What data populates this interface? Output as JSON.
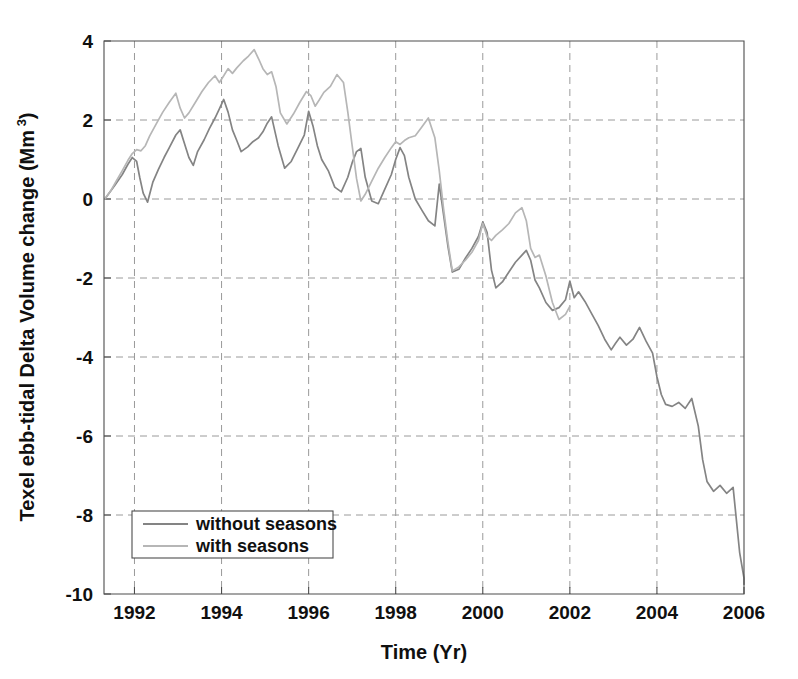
{
  "chart_data": {
    "type": "line",
    "title": "",
    "xlabel": "Time (Yr)",
    "ylabel": "Texel ebb-tidal Delta Volume change (Mm",
    "ylabel_superscript": "3",
    "ylabel_suffix": ")",
    "xlim": [
      1991.3,
      2006.0
    ],
    "ylim": [
      -10,
      4
    ],
    "xticks": [
      "1992",
      "1994",
      "1996",
      "1998",
      "2000",
      "2002",
      "2004",
      "2006"
    ],
    "xtick_values": [
      1992,
      1994,
      1996,
      1998,
      2000,
      2002,
      2004,
      2006
    ],
    "yticks": [
      "4",
      "2",
      "0",
      "-2",
      "-4",
      "-6",
      "-8",
      "-10"
    ],
    "ytick_values": [
      4,
      2,
      0,
      -2,
      -4,
      -6,
      -8,
      -10
    ],
    "grid": true,
    "grid_style": "dashed",
    "legend_position": "lower-left",
    "colors": {
      "without_seasons": "#848484",
      "with_seasons": "#b6b6b6",
      "axis": "#4d4d4d",
      "grid": "#9a9a9a",
      "text": "#101010",
      "background": "#ffffff"
    },
    "series": [
      {
        "name": "without seasons",
        "color": "#848484",
        "x": [
          1991.32,
          1991.55,
          1991.72,
          1991.85,
          1991.95,
          1992.05,
          1992.12,
          1992.2,
          1992.3,
          1992.42,
          1992.55,
          1992.68,
          1992.8,
          1992.95,
          1993.05,
          1993.15,
          1993.25,
          1993.35,
          1993.45,
          1993.6,
          1993.72,
          1993.85,
          1993.95,
          1994.05,
          1994.15,
          1994.25,
          1994.35,
          1994.45,
          1994.6,
          1994.72,
          1994.85,
          1994.95,
          1995.05,
          1995.15,
          1995.3,
          1995.45,
          1995.6,
          1995.75,
          1995.9,
          1996.0,
          1996.1,
          1996.2,
          1996.3,
          1996.45,
          1996.6,
          1996.75,
          1996.9,
          1997.0,
          1997.1,
          1997.2,
          1997.3,
          1997.45,
          1997.6,
          1997.75,
          1997.9,
          1998.0,
          1998.1,
          1998.2,
          1998.3,
          1998.45,
          1998.6,
          1998.75,
          1998.9,
          1999.0,
          1999.1,
          1999.2,
          1999.3,
          1999.45,
          1999.6,
          1999.75,
          1999.9,
          2000.0,
          2000.1,
          2000.2,
          2000.3,
          2000.45,
          2000.6,
          2000.75,
          2000.9,
          2001.0,
          2001.1,
          2001.2,
          2001.3,
          2001.45,
          2001.6,
          2001.75,
          2001.9,
          2002.0,
          2002.1,
          2002.2,
          2002.35,
          2002.5,
          2002.65,
          2002.8,
          2002.95,
          2003.05,
          2003.15,
          2003.3,
          2003.45,
          2003.6,
          2003.75,
          2003.9,
          2004.0,
          2004.1,
          2004.2,
          2004.35,
          2004.5,
          2004.65,
          2004.8,
          2004.95,
          2005.05,
          2005.15,
          2005.3,
          2005.45,
          2005.6,
          2005.75,
          2005.9,
          2006.0
        ],
        "y": [
          0.0,
          0.35,
          0.62,
          0.88,
          1.05,
          0.95,
          0.55,
          0.15,
          -0.08,
          0.42,
          0.75,
          1.05,
          1.3,
          1.62,
          1.75,
          1.4,
          1.05,
          0.85,
          1.2,
          1.5,
          1.78,
          2.05,
          2.28,
          2.52,
          2.2,
          1.75,
          1.48,
          1.2,
          1.32,
          1.45,
          1.55,
          1.7,
          1.92,
          2.08,
          1.35,
          0.78,
          0.95,
          1.28,
          1.62,
          2.22,
          1.85,
          1.35,
          1.0,
          0.72,
          0.3,
          0.18,
          0.55,
          0.92,
          1.2,
          1.28,
          0.55,
          -0.05,
          -0.12,
          0.25,
          0.62,
          1.0,
          1.3,
          1.1,
          0.55,
          0.0,
          -0.28,
          -0.55,
          -0.68,
          0.38,
          -0.4,
          -1.2,
          -1.85,
          -1.78,
          -1.5,
          -1.25,
          -0.95,
          -0.58,
          -0.85,
          -1.8,
          -2.25,
          -2.1,
          -1.85,
          -1.6,
          -1.42,
          -1.3,
          -1.55,
          -2.05,
          -2.25,
          -2.62,
          -2.82,
          -2.75,
          -2.55,
          -2.08,
          -2.5,
          -2.35,
          -2.6,
          -2.9,
          -3.2,
          -3.55,
          -3.82,
          -3.65,
          -3.5,
          -3.7,
          -3.55,
          -3.25,
          -3.6,
          -3.9,
          -4.5,
          -4.95,
          -5.2,
          -5.25,
          -5.15,
          -5.3,
          -5.05,
          -5.75,
          -6.6,
          -7.15,
          -7.4,
          -7.25,
          -7.45,
          -7.3,
          -8.95,
          -9.6
        ],
        "y_tail": [
          -9.6,
          -9.62,
          -9.7,
          -9.75
        ]
      },
      {
        "name": "with seasons",
        "color": "#b6b6b6",
        "x": [
          1991.32,
          1991.45,
          1991.58,
          1991.72,
          1991.85,
          1991.95,
          1992.05,
          1992.15,
          1992.25,
          1992.35,
          1992.5,
          1992.65,
          1992.8,
          1992.95,
          1993.05,
          1993.15,
          1993.25,
          1993.4,
          1993.55,
          1993.7,
          1993.85,
          1993.95,
          1994.05,
          1994.15,
          1994.25,
          1994.35,
          1994.5,
          1994.62,
          1994.75,
          1994.85,
          1994.95,
          1995.05,
          1995.15,
          1995.25,
          1995.35,
          1995.5,
          1995.65,
          1995.8,
          1995.95,
          1996.05,
          1996.15,
          1996.25,
          1996.35,
          1996.5,
          1996.65,
          1996.8,
          1996.9,
          1997.0,
          1997.1,
          1997.2,
          1997.3,
          1997.45,
          1997.6,
          1997.75,
          1997.9,
          1998.0,
          1998.1,
          1998.2,
          1998.3,
          1998.45,
          1998.6,
          1998.75,
          1998.9,
          1999.0,
          1999.1,
          1999.2,
          1999.3,
          1999.45,
          1999.6,
          1999.75,
          1999.9,
          2000.0,
          2000.1,
          2000.2,
          2000.3,
          2000.45,
          2000.6,
          2000.75,
          2000.9,
          2001.0,
          2001.1,
          2001.2,
          2001.3,
          2001.45,
          2001.6,
          2001.75,
          2001.9,
          2002.0
        ],
        "y": [
          0.0,
          0.2,
          0.45,
          0.72,
          0.98,
          1.15,
          1.25,
          1.22,
          1.35,
          1.6,
          1.9,
          2.2,
          2.45,
          2.68,
          2.3,
          2.05,
          2.18,
          2.45,
          2.72,
          2.95,
          3.12,
          2.95,
          3.12,
          3.3,
          3.18,
          3.32,
          3.5,
          3.62,
          3.78,
          3.55,
          3.3,
          3.15,
          3.22,
          2.85,
          2.18,
          1.9,
          2.15,
          2.45,
          2.72,
          2.62,
          2.35,
          2.52,
          2.7,
          2.85,
          3.15,
          2.95,
          2.2,
          1.35,
          0.52,
          -0.05,
          0.12,
          0.45,
          0.78,
          1.05,
          1.3,
          1.45,
          1.38,
          1.48,
          1.55,
          1.6,
          1.82,
          2.05,
          1.55,
          0.72,
          -0.25,
          -1.1,
          -1.82,
          -1.72,
          -1.55,
          -1.35,
          -1.05,
          -0.62,
          -0.95,
          -1.05,
          -0.92,
          -0.78,
          -0.62,
          -0.35,
          -0.22,
          -0.55,
          -1.25,
          -1.48,
          -1.42,
          -1.95,
          -2.62,
          -3.05,
          -2.92,
          -2.72
        ],
        "y_tail": []
      }
    ]
  },
  "legend": {
    "entries": [
      {
        "label": "without seasons",
        "color": "#848484"
      },
      {
        "label": "with seasons",
        "color": "#b6b6b6"
      }
    ]
  }
}
